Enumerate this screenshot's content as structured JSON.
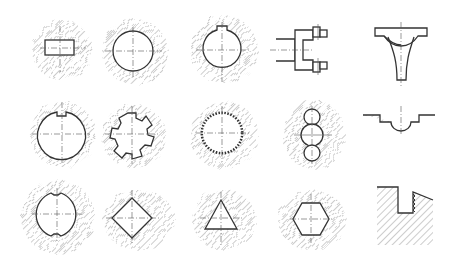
{
  "diagram": {
    "colors": {
      "line": "#333333",
      "hatch": "#9a9a9a",
      "center": "#555555",
      "background": "#ffffff"
    },
    "rows": [
      {
        "items": [
          {
            "id": "rect-hole",
            "label": "rectangular hole in round section"
          },
          {
            "id": "round-hole",
            "label": "round hole"
          },
          {
            "id": "keyway-hole",
            "label": "round hole with keyway"
          },
          {
            "id": "fork-part",
            "label": "fork / clevis part"
          },
          {
            "id": "y-bracket",
            "label": "Y-shaped bracket with semicircular seat"
          }
        ]
      },
      {
        "items": [
          {
            "id": "double-notch-hole",
            "label": "round hole with notch"
          },
          {
            "id": "spline-hole",
            "label": "splined hole (6 splines)"
          },
          {
            "id": "serrated-hole",
            "label": "serrated / involute spline hole"
          },
          {
            "id": "three-circle-hole",
            "label": "stacked triple circular hole"
          },
          {
            "id": "semicircle-groove",
            "label": "stepped groove with semicircular bottom"
          }
        ]
      },
      {
        "items": [
          {
            "id": "flat-notch-hole",
            "label": "round hole with two notches"
          },
          {
            "id": "square-hole",
            "label": "square (diamond) hole"
          },
          {
            "id": "triangle-hole",
            "label": "triangular hole"
          },
          {
            "id": "hex-hole",
            "label": "hexagonal hole"
          },
          {
            "id": "thread-groove",
            "label": "stepped slot with thread"
          }
        ]
      }
    ]
  }
}
